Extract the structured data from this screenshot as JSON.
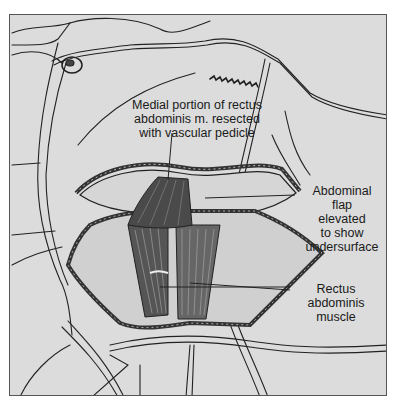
{
  "figure": {
    "background_color": "#dcdcdc",
    "line_color": "#222222",
    "muscle_color": "#4a4a4a",
    "labels": {
      "resected_muscle": [
        "Medial portion of rectus",
        "abdominis m. resected",
        "with vascular pedicle"
      ],
      "abdominal_flap": [
        "Abdominal",
        "flap",
        "elevated",
        "to show",
        "undersurface"
      ],
      "rectus_muscle": [
        "Rectus",
        "abdominis",
        "muscle"
      ]
    }
  }
}
